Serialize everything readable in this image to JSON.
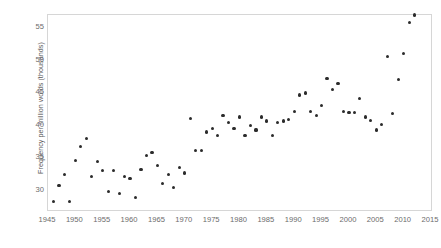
{
  "chart_data": {
    "type": "scatter",
    "title": "",
    "xlabel": "",
    "ylabel": "Frequency per million words (thousands)",
    "xlim": [
      1945,
      2015
    ],
    "ylim": [
      27,
      57
    ],
    "xticks": [
      1945,
      1950,
      1955,
      1960,
      1965,
      1970,
      1975,
      1980,
      1985,
      1990,
      1995,
      2000,
      2005,
      2010,
      2015
    ],
    "yticks": [
      30,
      35,
      40,
      45,
      50,
      55
    ],
    "grid": false,
    "legend": "none",
    "marker_color": "#2b2b2b",
    "x": [
      1946,
      1947,
      1948,
      1949,
      1950,
      1951,
      1952,
      1953,
      1954,
      1955,
      1956,
      1957,
      1958,
      1959,
      1960,
      1961,
      1962,
      1963,
      1964,
      1965,
      1966,
      1967,
      1968,
      1969,
      1970,
      1971,
      1972,
      1973,
      1974,
      1975,
      1976,
      1977,
      1978,
      1979,
      1980,
      1981,
      1982,
      1983,
      1984,
      1985,
      1986,
      1987,
      1988,
      1989,
      1990,
      1991,
      1992,
      1993,
      1994,
      1995,
      1996,
      1997,
      1998,
      1999,
      2000,
      2001,
      2002,
      2003,
      2004,
      2005,
      2006,
      2007,
      2008,
      2009,
      2010,
      2011,
      2012
    ],
    "y": [
      28.3,
      30.8,
      32.4,
      28.3,
      34.6,
      36.8,
      38.0,
      32.1,
      34.4,
      33.1,
      29.9,
      33.1,
      29.5,
      32.1,
      31.9,
      28.9,
      33.2,
      35.4,
      35.8,
      33.8,
      31.1,
      32.5,
      30.5,
      33.5,
      32.7,
      41.1,
      36.2,
      36.2,
      39.0,
      39.5,
      38.5,
      41.6,
      40.5,
      39.6,
      41.3,
      38.5,
      40.0,
      39.3,
      41.3,
      40.7,
      38.5,
      40.4,
      40.7,
      40.9,
      42.1,
      44.7,
      45.0,
      42.1,
      41.5,
      43.1,
      47.2,
      45.5,
      46.4,
      42.1,
      42.0,
      42.0,
      44.2,
      41.3,
      40.8,
      39.3,
      40.2,
      50.6,
      41.8,
      47.1,
      51.1,
      55.9
    ],
    "series_name": "Frequency per million words",
    "point_count": 67
  },
  "axes": {
    "y_title": "Frequency per million words (thousands)",
    "y_tick_labels": [
      "55",
      "50",
      "45",
      "40",
      "35",
      "30"
    ],
    "x_tick_labels": [
      "1945",
      "1950",
      "1955",
      "1960",
      "1965",
      "1970",
      "1975",
      "1980",
      "1985",
      "1990",
      "1995",
      "2000",
      "2005",
      "2010",
      "2015"
    ]
  }
}
